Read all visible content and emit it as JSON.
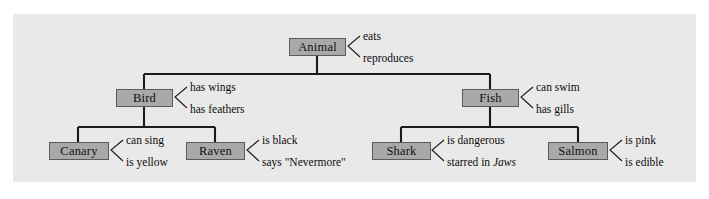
{
  "diagram": {
    "type": "semantic-network",
    "title": "",
    "levels": 3,
    "colors": {
      "node_fill": "#a9a9a9",
      "node_border": "#5a5a5a",
      "link": "#1b1b1b",
      "panel_background": "#e9e9e9",
      "page_background": "#ffffff",
      "text": "#101010"
    },
    "nodes": [
      {
        "id": "animal",
        "label": "Animal",
        "level": 0,
        "properties": [
          "eats",
          "reproduces"
        ]
      },
      {
        "id": "bird",
        "label": "Bird",
        "level": 1,
        "parent": "animal",
        "properties": [
          "has wings",
          "has feathers"
        ]
      },
      {
        "id": "fish",
        "label": "Fish",
        "level": 1,
        "parent": "animal",
        "properties": [
          "can swim",
          "has gills"
        ]
      },
      {
        "id": "canary",
        "label": "Canary",
        "level": 2,
        "parent": "bird",
        "properties": [
          "can sing",
          "is yellow"
        ]
      },
      {
        "id": "raven",
        "label": "Raven",
        "level": 2,
        "parent": "bird",
        "properties": [
          "is black",
          "says \"Nevermore\""
        ]
      },
      {
        "id": "shark",
        "label": "Shark",
        "level": 2,
        "parent": "fish",
        "properties": [
          "is dangerous",
          "starred in Jaws"
        ]
      },
      {
        "id": "salmon",
        "label": "Salmon",
        "level": 2,
        "parent": "fish",
        "properties": [
          "is pink",
          "is edible"
        ]
      }
    ],
    "properties": {
      "animal_top": "eats",
      "animal_bottom": "reproduces",
      "bird_top": "has wings",
      "bird_bottom": "has feathers",
      "fish_top": "can swim",
      "fish_bottom": "has gills",
      "canary_top": "can sing",
      "canary_bottom": "is yellow",
      "raven_top": "is black",
      "raven_bottom": "says \"Nevermore\"",
      "shark_top": "is dangerous",
      "shark_bottom_prefix": "starred in ",
      "shark_bottom_italic": "Jaws",
      "salmon_top": "is pink",
      "salmon_bottom": "is edible"
    },
    "labels": {
      "animal": "Animal",
      "bird": "Bird",
      "fish": "Fish",
      "canary": "Canary",
      "raven": "Raven",
      "shark": "Shark",
      "salmon": "Salmon"
    }
  }
}
